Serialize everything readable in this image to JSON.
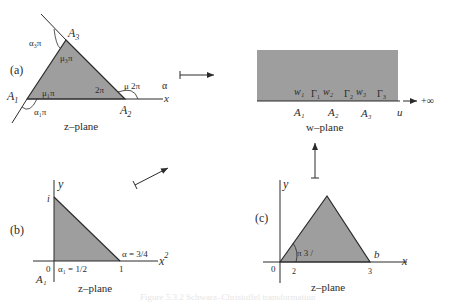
{
  "colors": {
    "fill": "#9e9e9e",
    "stroke": "#2b2b2b",
    "background": "#ffffff",
    "caption": "#e6e6e6"
  },
  "panel_a": {
    "tag": "(a)",
    "plane_label": "z–plane",
    "vertices": [
      "A1",
      "A2",
      "A3"
    ],
    "vertex_labels": {
      "A1": "A",
      "A1_sub": "1",
      "A2": "A",
      "A2_sub": "2",
      "A3": "A",
      "A3_sub": "3"
    },
    "interior_angles": {
      "mu1": "μ₁π",
      "mu2": "2π",
      "mu3": "μ₃π"
    },
    "exterior_angles": {
      "alpha1": "α₁π",
      "alpha2": "μ 2π",
      "alpha3": "α₃π"
    },
    "alpha_label": "α",
    "axis_label": "x"
  },
  "panel_w": {
    "plane_label": "w–plane",
    "points": [
      "w₁",
      "Γ₁",
      "w₂",
      "Γ₂",
      "w₃",
      "Γ₃"
    ],
    "vertex_labels": [
      "A₁",
      "A₂",
      "A₃"
    ],
    "axis_label": "u",
    "infinity_label": "+∞"
  },
  "panel_b": {
    "tag": "(b)",
    "plane_label": "z–plane",
    "y_label": "y",
    "x_label": "x",
    "x_sup": "2",
    "i_label": "i",
    "origin": "0",
    "one": "1",
    "alpha1": "α₁ = 1/2",
    "alpha2": "α   = 3/4",
    "vertex": "A₁"
  },
  "panel_c": {
    "tag": "(c)",
    "plane_label": "z–plane",
    "y_label": "y",
    "x_label": "x",
    "origin": "0",
    "angle_label": "π 3   /",
    "b_label": "b",
    "tick_2": "2",
    "tick_3": "3"
  },
  "caption": "Figure 5.3.2  Schwarz–Christoffel transformation"
}
